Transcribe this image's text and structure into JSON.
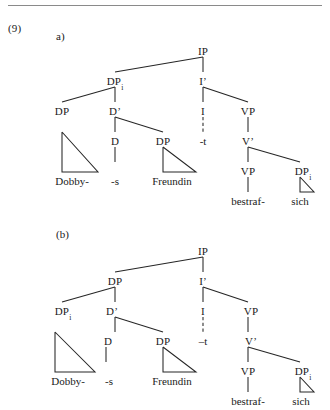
{
  "example": {
    "number": "(9)",
    "divider": true
  },
  "trees": [
    {
      "id": "tree-a",
      "label": "a)",
      "nodes": [
        {
          "name": "ip",
          "text": "IP",
          "sub": ""
        },
        {
          "name": "dp-top",
          "text": "DP",
          "sub": "i"
        },
        {
          "name": "i-bar",
          "text": "I’",
          "sub": ""
        },
        {
          "name": "dp-spec",
          "text": "DP",
          "sub": ""
        },
        {
          "name": "d-bar",
          "text": "D’",
          "sub": ""
        },
        {
          "name": "i-head",
          "text": "I",
          "sub": ""
        },
        {
          "name": "vp-upper",
          "text": "VP",
          "sub": ""
        },
        {
          "name": "d-head",
          "text": "D",
          "sub": ""
        },
        {
          "name": "dp-comp",
          "text": "DP",
          "sub": ""
        },
        {
          "name": "v-bar",
          "text": "V’",
          "sub": ""
        },
        {
          "name": "vp-lower",
          "text": "VP",
          "sub": ""
        },
        {
          "name": "dp-refl",
          "text": "DP",
          "sub": "i"
        }
      ],
      "leaves": [
        {
          "name": "leaf-dobby",
          "text": "Dobby-"
        },
        {
          "name": "leaf-s",
          "text": "-s"
        },
        {
          "name": "leaf-freundin",
          "text": "Freundin"
        },
        {
          "name": "leaf-trace",
          "text": "-t"
        },
        {
          "name": "leaf-bestraf",
          "text": "bestraf-"
        },
        {
          "name": "leaf-sich",
          "text": "sich"
        }
      ]
    },
    {
      "id": "tree-b",
      "label": "(b)",
      "nodes": [
        {
          "name": "ip",
          "text": "IP",
          "sub": ""
        },
        {
          "name": "dp-top",
          "text": "DP",
          "sub": ""
        },
        {
          "name": "i-bar",
          "text": "I’",
          "sub": ""
        },
        {
          "name": "dp-spec",
          "text": "DP",
          "sub": "i"
        },
        {
          "name": "d-bar",
          "text": "D’",
          "sub": ""
        },
        {
          "name": "i-head",
          "text": "I",
          "sub": ""
        },
        {
          "name": "vp-upper",
          "text": "VP",
          "sub": ""
        },
        {
          "name": "d-head",
          "text": "D",
          "sub": ""
        },
        {
          "name": "dp-comp",
          "text": "DP",
          "sub": ""
        },
        {
          "name": "v-bar",
          "text": "V’",
          "sub": ""
        },
        {
          "name": "vp-lower",
          "text": "VP",
          "sub": ""
        },
        {
          "name": "dp-refl",
          "text": "DP",
          "sub": "i"
        }
      ],
      "leaves": [
        {
          "name": "leaf-dobby",
          "text": "Dobby-"
        },
        {
          "name": "leaf-s",
          "text": "-s"
        },
        {
          "name": "leaf-freundin",
          "text": "Freundin"
        },
        {
          "name": "leaf-trace",
          "text": "–t"
        },
        {
          "name": "leaf-bestraf",
          "text": "bestraf-"
        },
        {
          "name": "leaf-sich",
          "text": "sich"
        }
      ]
    }
  ],
  "colors": {
    "ink": "#262626",
    "rule": "#8a8a8a",
    "paper": "#ffffff"
  }
}
